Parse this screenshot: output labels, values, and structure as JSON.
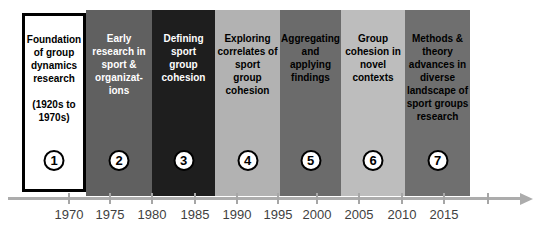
{
  "diagram": {
    "name": "Timeline of sport group dynamics research phases",
    "phases": [
      {
        "number": "1",
        "label": "Foundation\nof group\ndynamics\nresearch\n\n(1920s to\n1970s)",
        "bg": "#ffffff",
        "text_color": "#000000",
        "border_color": "#000000"
      },
      {
        "number": "2",
        "label": "Early\nresearch in\nsport &\norganizat-\nions",
        "bg": "#606060",
        "text_color": "#ffffff"
      },
      {
        "number": "3",
        "label": "Defining\nsport\ngroup\ncohesion",
        "bg": "#1e1e1e",
        "text_color": "#ffffff"
      },
      {
        "number": "4",
        "label": "Exploring\ncorrelates of\nsport\ngroup\ncohesion",
        "bg": "#b2b2b2",
        "text_color": "#000000"
      },
      {
        "number": "5",
        "label": "Aggregating\nand applying\nfindings",
        "bg": "#6b6b6b",
        "text_color": "#000000"
      },
      {
        "number": "6",
        "label": "Group\ncohesion in\nnovel\ncontexts",
        "bg": "#bdbdbd",
        "text_color": "#000000"
      },
      {
        "number": "7",
        "label": "Methods &\ntheory\nadvances in\ndiverse\nlandscape of\nsport groups\nresearch",
        "bg": "#6f6f6f",
        "text_color": "#000000"
      }
    ],
    "badge": {
      "fill": "#ffffff",
      "ring": "#000000",
      "number_color": "#000000"
    },
    "axis": {
      "years": [
        "1970",
        "1975",
        "1980",
        "1985",
        "1990",
        "1995",
        "2000",
        "2005",
        "2010",
        "2015"
      ],
      "line_color": "#acacac",
      "label_color": "#3f3f3f",
      "has_right_arrow": true,
      "extra_unlabeled_tick": true
    }
  }
}
